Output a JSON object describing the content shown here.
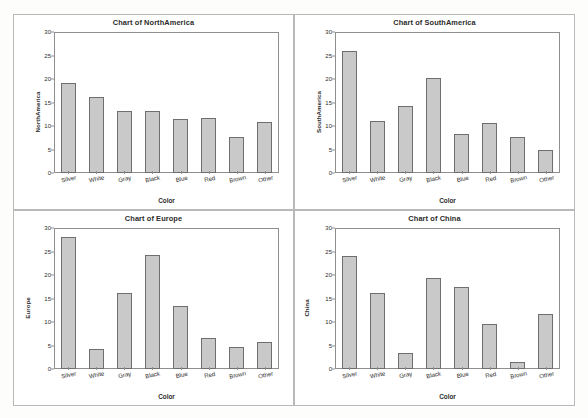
{
  "figure": {
    "panel_count": 4,
    "bar_fill_color": "#c9c9c9",
    "bar_border_color": "#6e6e6e",
    "frame_color": "#8f8f8f"
  },
  "chart_data": [
    {
      "type": "bar",
      "title": "Chart of NorthAmerica",
      "xlabel": "Color",
      "ylabel": "NorthAmerica",
      "categories": [
        "Silver",
        "White",
        "Gray",
        "Black",
        "Blue",
        "Red",
        "Brown",
        "Other"
      ],
      "values": [
        19.2,
        16.1,
        13.2,
        13.2,
        11.4,
        11.6,
        7.6,
        10.8
      ],
      "ylim": [
        0,
        30
      ],
      "yticks": [
        0,
        5,
        10,
        15,
        20,
        25,
        30
      ],
      "grid": false,
      "legend": "none"
    },
    {
      "type": "bar",
      "title": "Chart of SouthAmerica",
      "xlabel": "Color",
      "ylabel": "SouthAmerica",
      "categories": [
        "Silver",
        "White",
        "Gray",
        "Black",
        "Blue",
        "Red",
        "Brown",
        "Other"
      ],
      "values": [
        25.9,
        11.1,
        14.2,
        20.3,
        8.4,
        10.6,
        7.6,
        4.8
      ],
      "ylim": [
        0,
        30
      ],
      "yticks": [
        0,
        5,
        10,
        15,
        20,
        25,
        30
      ],
      "grid": false,
      "legend": "none"
    },
    {
      "type": "bar",
      "title": "Chart of Europe",
      "xlabel": "Color",
      "ylabel": "Europe",
      "categories": [
        "Silver",
        "White",
        "Gray",
        "Black",
        "Blue",
        "Red",
        "Brown",
        "Other"
      ],
      "values": [
        28.0,
        4.2,
        16.2,
        24.2,
        13.4,
        6.7,
        4.6,
        5.7
      ],
      "ylim": [
        0,
        30
      ],
      "yticks": [
        0,
        5,
        10,
        15,
        20,
        25,
        30
      ],
      "grid": false,
      "legend": "none"
    },
    {
      "type": "bar",
      "title": "Chart of China",
      "xlabel": "Color",
      "ylabel": "China",
      "categories": [
        "Silver",
        "White",
        "Gray",
        "Black",
        "Blue",
        "Red",
        "Brown",
        "Other"
      ],
      "values": [
        24.0,
        16.2,
        3.4,
        19.3,
        17.4,
        9.6,
        1.5,
        11.8
      ],
      "ylim": [
        0,
        30
      ],
      "yticks": [
        0,
        5,
        10,
        15,
        20,
        25,
        30
      ],
      "grid": false,
      "legend": "none"
    }
  ]
}
